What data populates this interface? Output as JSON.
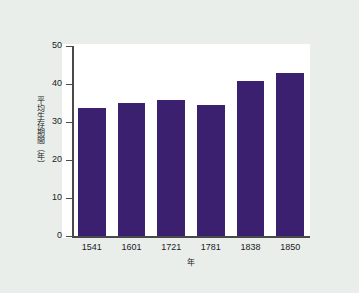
{
  "chart_data": {
    "type": "bar",
    "title": "",
    "subtitle": "",
    "categories": [
      "1541",
      "1601",
      "1721",
      "1781",
      "1838",
      "1850"
    ],
    "values": [
      33.7,
      35.0,
      35.8,
      34.5,
      40.8,
      42.8
    ],
    "series": [
      {
        "name": "平均生存期間",
        "values": [
          33.7,
          35.0,
          35.8,
          34.5,
          40.8,
          42.8
        ]
      }
    ],
    "xlabel": "年",
    "ylabel": "平均生存期間（年）",
    "ylim": [
      0,
      50
    ],
    "yticks": [
      "0",
      "10",
      "20",
      "30",
      "40",
      "50"
    ],
    "ytick_values": [
      0,
      10,
      20,
      30,
      40,
      50
    ],
    "grid": false,
    "legend": false,
    "legend_position": "none",
    "bar_color": "#3b2070",
    "plot_background": "#ffffff",
    "figure_background": "#e9eeeb",
    "axis_color": "#4a4a4a"
  }
}
